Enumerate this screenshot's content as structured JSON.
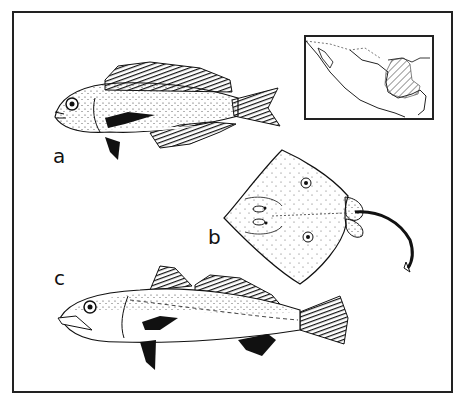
{
  "plate": {
    "labels": {
      "a": "a",
      "b": "b",
      "c": "c"
    },
    "figures": [
      {
        "id": "a",
        "subject": "fish-cichlid-like",
        "description": "spiny-rayed fish with dark dorsal, anal, pelvic, pectoral and caudal fins, stippled body"
      },
      {
        "id": "b",
        "subject": "stingray",
        "description": "diamond-shaped ray with two ocellated spots and long slender tail"
      },
      {
        "id": "c",
        "subject": "fish-drum-like",
        "description": "elongate fish with spiny and soft dorsal fins, lateral line, stippled upper body"
      }
    ],
    "inset_map": {
      "subject": "map-of-mexico",
      "shaded_region": "eastern Gulf coast and Yucatan region (hatched)"
    }
  },
  "colors": {
    "ink": "#111111",
    "paper": "#ffffff",
    "frame": "#222222"
  }
}
